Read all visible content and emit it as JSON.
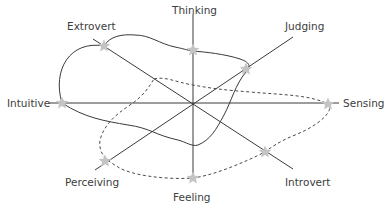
{
  "diagram": {
    "type": "radar-style personality profile",
    "center": {
      "x": 193,
      "y": 103
    },
    "axes": [
      {
        "id": "thinking-feeling",
        "from": {
          "x": 193,
          "y": 14
        },
        "to": {
          "x": 193,
          "y": 180
        }
      },
      {
        "id": "intuitive-sensing",
        "from": {
          "x": 50,
          "y": 103
        },
        "to": {
          "x": 338,
          "y": 103
        }
      },
      {
        "id": "extrovert-introvert",
        "from": {
          "x": 93,
          "y": 39
        },
        "to": {
          "x": 293,
          "y": 169
        }
      },
      {
        "id": "perceiving-judging",
        "from": {
          "x": 95,
          "y": 170
        },
        "to": {
          "x": 293,
          "y": 37
        }
      }
    ],
    "labels": {
      "thinking": "Thinking",
      "feeling": "Feeling",
      "intuitive": "Intuitive",
      "sensing": "Sensing",
      "extrovert": "Extrovert",
      "introvert": "Introvert",
      "judging": "Judging",
      "perceiving": "Perceiving"
    },
    "profiles": [
      {
        "name": "solid-profile",
        "line_style": "solid",
        "points": [
          {
            "trait": "Extrovert",
            "x": 104,
            "y": 46
          },
          {
            "trait": "Thinking",
            "x": 193,
            "y": 50
          },
          {
            "trait": "Judging",
            "x": 246,
            "y": 69
          },
          {
            "trait": "Intuitive",
            "x": 62,
            "y": 103
          }
        ]
      },
      {
        "name": "dashed-profile",
        "line_style": "dashed",
        "points": [
          {
            "trait": "Sensing",
            "x": 328,
            "y": 104
          },
          {
            "trait": "Introvert",
            "x": 265,
            "y": 152
          },
          {
            "trait": "Feeling",
            "x": 193,
            "y": 178
          },
          {
            "trait": "Perceiving",
            "x": 105,
            "y": 161
          }
        ]
      }
    ],
    "colors": {
      "line": "#3a3a3a",
      "star": "#c4c4c4",
      "label": "#3d3d3d",
      "background": "#ffffff"
    }
  }
}
